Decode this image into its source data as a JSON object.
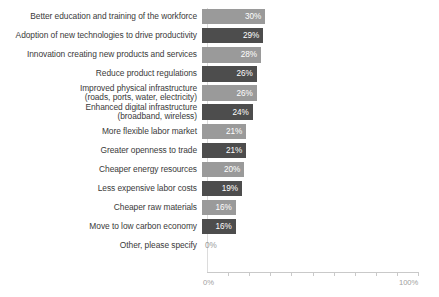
{
  "chart_data": {
    "type": "bar",
    "orientation": "horizontal",
    "title": "",
    "subtitle": "",
    "xlabel": "",
    "ylabel": "",
    "xlim": [
      0,
      100
    ],
    "grid": false,
    "legend": null,
    "tick_interval": 10,
    "axis_ticks": [
      "0%",
      "100%"
    ],
    "value_suffix": "%",
    "series_colors": {
      "light": "#9a9a9a",
      "dark": "#4d4d4d",
      "zero_label": "#9a9a9a",
      "axis": "#c9c9c9"
    },
    "categories": [
      "Better education and training of the workforce",
      "Adoption of new technologies to drive productivity",
      "Innovation creating new products and services",
      "Reduce product regulations",
      "Improved physical infrastructure\n(roads, ports, water, electricity)",
      "Enhanced digital infrastructure\n(broadband, wireless)",
      "More flexible labor market",
      "Greater openness to trade",
      "Cheaper energy resources",
      "Less expensive labor costs",
      "Cheaper raw materials",
      "Move to low carbon economy",
      "Other, please specify"
    ],
    "values": [
      30,
      29,
      28,
      26,
      26,
      24,
      21,
      21,
      20,
      19,
      16,
      16,
      0
    ],
    "value_labels": [
      "30%",
      "29%",
      "28%",
      "26%",
      "26%",
      "24%",
      "21%",
      "21%",
      "20%",
      "19%",
      "16%",
      "16%",
      "0%"
    ],
    "bar_styles": [
      "light",
      "dark",
      "light",
      "dark",
      "light",
      "dark",
      "light",
      "dark",
      "light",
      "dark",
      "light",
      "dark",
      "zero"
    ]
  },
  "axis": {
    "start_label": "0%",
    "end_label": "100%"
  }
}
